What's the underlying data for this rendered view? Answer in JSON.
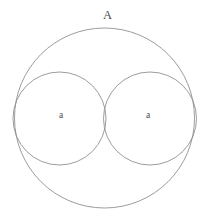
{
  "figure": {
    "title_label": "A",
    "background_color": "#ffffff",
    "stroke_color": "#8a8a8a",
    "text_color": "#4a4a4a",
    "canvas": {
      "width": 209,
      "height": 221
    }
  },
  "chart_data": {
    "type": "diagram",
    "subtype": "geometric-circle-packing",
    "title": "",
    "shapes": [
      {
        "id": "outer-circle",
        "role": "outer",
        "label": "A",
        "cx": 104.5,
        "cy": 118.0,
        "r": 90.0,
        "stroke": "#8a8a8a",
        "fill": "none"
      },
      {
        "id": "left-inner-circle",
        "role": "inner",
        "label": "a",
        "cx": 59.5,
        "cy": 118.5,
        "r": 46.5,
        "stroke": "#8a8a8a",
        "fill": "none"
      },
      {
        "id": "right-inner-circle",
        "role": "inner",
        "label": "a",
        "cx": 150.0,
        "cy": 118.5,
        "r": 46.5,
        "stroke": "#8a8a8a",
        "fill": "none"
      }
    ],
    "labels": [
      {
        "id": "label-outer",
        "text": "A",
        "x": 107,
        "y": 15,
        "size": 12.5
      },
      {
        "id": "label-left-inner",
        "text": "a",
        "x": 61,
        "y": 116,
        "size": 9.5
      },
      {
        "id": "label-right-inner",
        "text": "a",
        "x": 148,
        "y": 116,
        "size": 9.5
      }
    ],
    "relations": [
      "left-inner-circle tangent to right-inner-circle",
      "left-inner-circle internally tangent to outer-circle",
      "right-inner-circle internally tangent to outer-circle"
    ],
    "legend": [],
    "grid": false,
    "axes": false
  }
}
